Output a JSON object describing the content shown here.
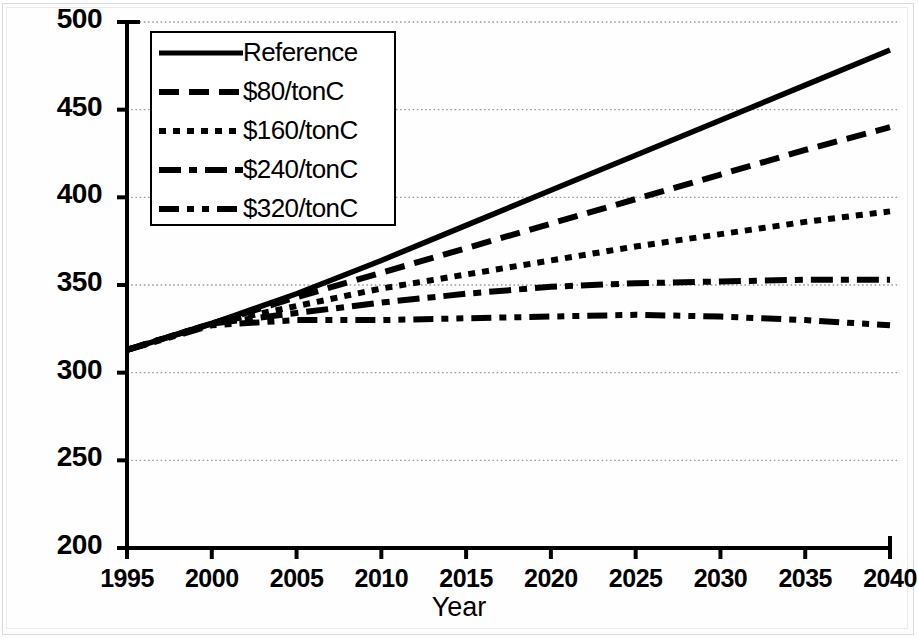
{
  "chart_data": {
    "type": "line",
    "title": "",
    "xlabel": "Year",
    "ylabel": "",
    "xlim": [
      1995,
      2040
    ],
    "ylim": [
      200,
      500
    ],
    "ytick_step": 50,
    "xtick_step": 5,
    "grid": true,
    "grid_style": "dotted-horizontal",
    "legend_position": "upper-left",
    "xticks": [
      "1995",
      "2000",
      "2005",
      "2010",
      "2015",
      "2020",
      "2025",
      "2030",
      "2035",
      "2040"
    ],
    "yticks": [
      "200",
      "250",
      "300",
      "350",
      "400",
      "450",
      "500"
    ],
    "x": [
      1995,
      2000,
      2005,
      2010,
      2015,
      2020,
      2025,
      2030,
      2035,
      2040
    ],
    "series": [
      {
        "name": "Reference",
        "style": "solid",
        "values": [
          313,
          328,
          345,
          364,
          384,
          404,
          424,
          444,
          464,
          484
        ]
      },
      {
        "name": "$80/tonC",
        "style": "dashed",
        "values": [
          313,
          328,
          343,
          357,
          371,
          385,
          399,
          413,
          427,
          440
        ]
      },
      {
        "name": "$160/tonC",
        "style": "dotted",
        "values": [
          313,
          328,
          338,
          348,
          356,
          364,
          372,
          379,
          386,
          392
        ]
      },
      {
        "name": "$240/tonC",
        "style": "dash-dot",
        "values": [
          313,
          328,
          334,
          340,
          345,
          349,
          351,
          352,
          353,
          353
        ]
      },
      {
        "name": "$320/tonC",
        "style": "dash-dot-dot",
        "values": [
          313,
          327,
          330,
          330,
          331,
          332,
          333,
          332,
          330,
          327
        ]
      }
    ],
    "colors": {
      "line": "#000000",
      "grid": "#9a9a9a",
      "axis": "#000000",
      "background": "#ffffff"
    }
  },
  "legend": {
    "entries": [
      {
        "label": "Reference"
      },
      {
        "label": "$80/tonC"
      },
      {
        "label": "$160/tonC"
      },
      {
        "label": "$240/tonC"
      },
      {
        "label": "$320/tonC"
      }
    ]
  },
  "axes": {
    "x_title": "Year"
  }
}
